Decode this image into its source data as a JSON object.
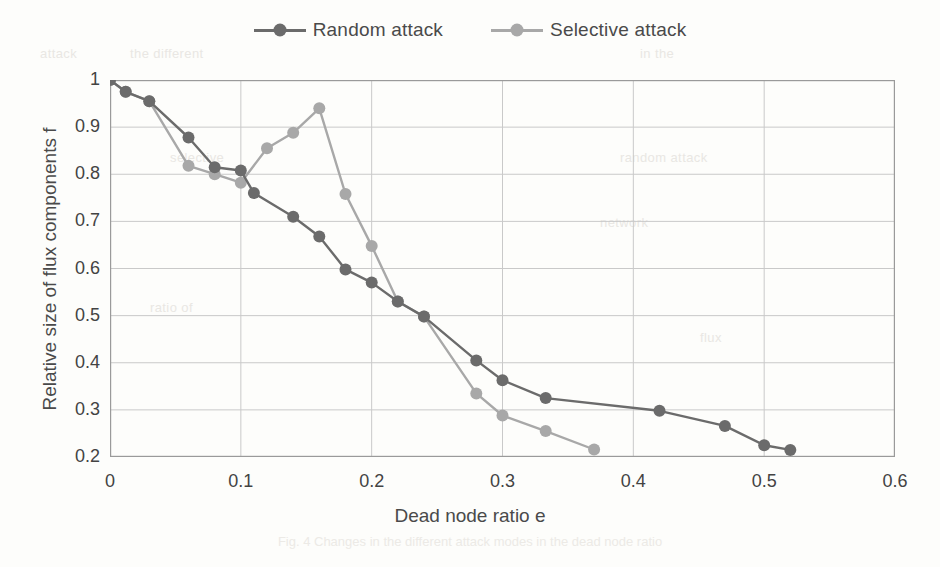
{
  "figure": {
    "caption": "Fig. 4  Changes in the different attack modes in the dead node ratio"
  },
  "legend": {
    "position": "top-center",
    "items": [
      {
        "label": "Random attack",
        "color": "#6b6b6b",
        "marker": "circle"
      },
      {
        "label": "Selective attack",
        "color": "#a8a8a8",
        "marker": "circle"
      }
    ]
  },
  "axes": {
    "xlabel": "Dead node ratio e",
    "ylabel": "Relative size of flux components f",
    "xticks": [
      "0",
      "0.1",
      "0.2",
      "0.3",
      "0.4",
      "0.5",
      "0.6"
    ],
    "yticks": [
      "1",
      "0.9",
      "0.8",
      "0.7",
      "0.6",
      "0.5",
      "0.4",
      "0.3",
      "0.2"
    ]
  },
  "chart_data": {
    "type": "line",
    "title": "",
    "xlabel": "Dead node ratio e",
    "ylabel": "Relative size of flux components f",
    "xlim": [
      0,
      0.6
    ],
    "ylim": [
      0.2,
      1
    ],
    "grid": true,
    "legend_position": "top-center",
    "series": [
      {
        "name": "Random attack",
        "color": "#6b6b6b",
        "points": [
          [
            0.0,
            1.0
          ],
          [
            0.012,
            0.975
          ],
          [
            0.03,
            0.955
          ],
          [
            0.06,
            0.878
          ],
          [
            0.08,
            0.815
          ],
          [
            0.1,
            0.808
          ],
          [
            0.11,
            0.76
          ],
          [
            0.14,
            0.71
          ],
          [
            0.16,
            0.668
          ],
          [
            0.18,
            0.598
          ],
          [
            0.2,
            0.57
          ],
          [
            0.22,
            0.53
          ],
          [
            0.24,
            0.498
          ],
          [
            0.28,
            0.405
          ],
          [
            0.3,
            0.363
          ],
          [
            0.333,
            0.325
          ],
          [
            0.42,
            0.298
          ],
          [
            0.47,
            0.266
          ],
          [
            0.5,
            0.225
          ],
          [
            0.52,
            0.215
          ]
        ]
      },
      {
        "name": "Selective attack",
        "color": "#a8a8a8",
        "points": [
          [
            0.0,
            1.0
          ],
          [
            0.012,
            0.975
          ],
          [
            0.03,
            0.955
          ],
          [
            0.06,
            0.818
          ],
          [
            0.08,
            0.8
          ],
          [
            0.1,
            0.782
          ],
          [
            0.12,
            0.855
          ],
          [
            0.14,
            0.888
          ],
          [
            0.16,
            0.94
          ],
          [
            0.18,
            0.758
          ],
          [
            0.2,
            0.648
          ],
          [
            0.22,
            0.53
          ],
          [
            0.24,
            0.498
          ],
          [
            0.28,
            0.335
          ],
          [
            0.3,
            0.288
          ],
          [
            0.333,
            0.255
          ],
          [
            0.37,
            0.216
          ]
        ]
      }
    ]
  },
  "ghost_text": [
    "attack",
    "the different",
    "in the",
    "selective",
    "random attack",
    "network",
    "ratio of",
    "flux",
    "node",
    "structure",
    "simulation",
    "results"
  ]
}
